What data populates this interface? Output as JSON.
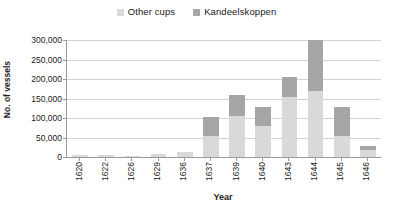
{
  "chart_data": {
    "type": "bar",
    "title": "",
    "subtitle": "",
    "xlabel": "Year",
    "ylabel": "No. of vessels",
    "stacked": true,
    "grid": true,
    "legend_position": "top-center",
    "ylim": [
      0,
      300000
    ],
    "ytick_labels": [
      "300,000",
      "250,000",
      "200,000",
      "150,000",
      "100,000",
      "50,000",
      "0"
    ],
    "ytick_values": [
      300000,
      250000,
      200000,
      150000,
      100000,
      50000,
      0
    ],
    "categories": [
      "1620",
      "1622",
      "1626",
      "1629",
      "1636",
      "1637",
      "1639",
      "1640",
      "1643",
      "1644",
      "1645",
      "1646"
    ],
    "series": [
      {
        "name": "Other cups",
        "color": "#d9d9d9",
        "values": [
          5000,
          6000,
          2000,
          8000,
          13000,
          55000,
          105000,
          80000,
          155000,
          170000,
          55000,
          18000
        ]
      },
      {
        "name": "Kandeelskoppen",
        "color": "#a6a6a6",
        "values": [
          0,
          0,
          0,
          0,
          0,
          47000,
          53000,
          48000,
          50000,
          130000,
          73000,
          10000
        ]
      }
    ],
    "totals": [
      5000,
      6000,
      2000,
      8000,
      13000,
      102000,
      158000,
      128000,
      205000,
      300000,
      128000,
      28000
    ],
    "axis_color": "#9a9a9a",
    "gridline_color": "#d2d2d2",
    "background": "#ffffff"
  }
}
